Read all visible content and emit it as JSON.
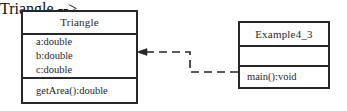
{
  "diagram": {
    "kind": "uml-class-diagram",
    "background_color": "#ffffff",
    "line_color": "#1a1a1a",
    "text_color": "#141414",
    "classes": [
      {
        "id": "triangle",
        "name": "Triangle",
        "attributes": [
          "a:double",
          "b:double",
          "c:double"
        ],
        "operations": [
          "getArea():double"
        ]
      },
      {
        "id": "example",
        "name": "Example4_3",
        "attributes": [],
        "operations": [
          "main():void"
        ]
      }
    ],
    "relationship": {
      "type": "dependency",
      "style": "dashed",
      "arrow_head": "open-arrow",
      "source": "Example4_3",
      "target": "Triangle",
      "direction": "right-to-left"
    }
  }
}
